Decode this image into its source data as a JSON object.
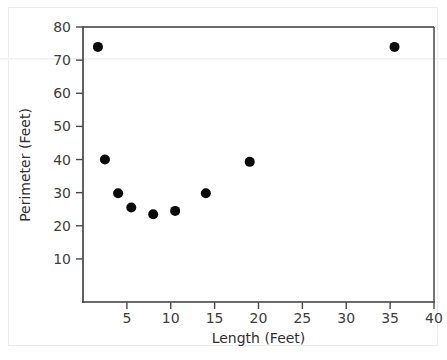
{
  "chart_data": {
    "type": "scatter",
    "title": "",
    "xlabel": "Length (Feet)",
    "ylabel": "Perimeter (Feet)",
    "xlim": [
      0,
      40
    ],
    "ylim": [
      -3,
      80
    ],
    "xticks": [
      5,
      10,
      15,
      20,
      25,
      30,
      35,
      40
    ],
    "xtick_labels": [
      "5",
      "10",
      "15",
      "20",
      "25",
      "30",
      "35",
      "40"
    ],
    "yticks": [
      10,
      20,
      30,
      40,
      50,
      60,
      70,
      80
    ],
    "ytick_labels": [
      "10",
      "20",
      "30",
      "40",
      "50",
      "60",
      "70",
      "80"
    ],
    "grid": false,
    "legend": false,
    "marker": "circle",
    "marker_color": "#0a0a0a",
    "marker_size": 5,
    "x": [
      1.7,
      2.5,
      4.0,
      5.5,
      8.0,
      10.5,
      14.0,
      19.0,
      35.5
    ],
    "y": [
      74.0,
      40.0,
      29.8,
      25.5,
      23.5,
      24.5,
      29.8,
      39.3,
      74.0
    ],
    "points": [
      {
        "x": 1.7,
        "y": 74.0
      },
      {
        "x": 2.5,
        "y": 40.0
      },
      {
        "x": 4.0,
        "y": 29.8
      },
      {
        "x": 5.5,
        "y": 25.5
      },
      {
        "x": 8.0,
        "y": 23.5
      },
      {
        "x": 10.5,
        "y": 24.5
      },
      {
        "x": 14.0,
        "y": 29.8
      },
      {
        "x": 19.0,
        "y": 39.3
      },
      {
        "x": 35.5,
        "y": 74.0
      }
    ]
  },
  "axes": {
    "x_title": "Length (Feet)",
    "y_title": "Perimeter (Feet)"
  },
  "colors": {
    "axis": "#3a3a3a",
    "text": "#3d3d3d",
    "marker": "#0a0a0a",
    "background": "#ffffff"
  }
}
